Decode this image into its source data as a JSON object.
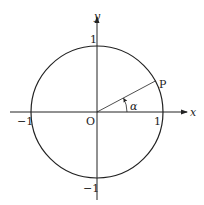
{
  "figure": {
    "type": "unit-circle",
    "colors": {
      "stroke": "#222222",
      "background": "#ffffff"
    },
    "axes": {
      "x_label": "x",
      "y_label": "y",
      "origin_label": "O"
    },
    "ticks": {
      "x_pos": "1",
      "x_neg": "−1",
      "y_pos": "1",
      "y_neg": "−1"
    },
    "point": {
      "label": "P",
      "angle_label": "α",
      "angle_degrees_approx": 28
    }
  }
}
